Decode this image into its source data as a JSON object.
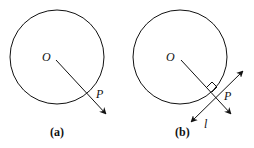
{
  "panels": [
    {
      "id": "a",
      "caption": "(a)",
      "center_label": "O",
      "point_label": "P"
    },
    {
      "id": "b",
      "caption": "(b)",
      "center_label": "O",
      "point_label": "P",
      "tangent_label": "l"
    }
  ],
  "colors": {
    "stroke": "#111111",
    "background": "#ffffff"
  }
}
